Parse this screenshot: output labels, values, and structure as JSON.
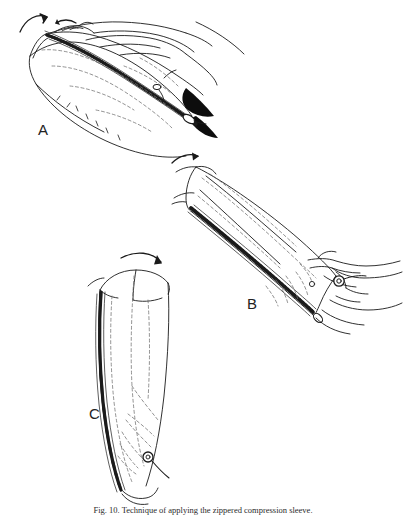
{
  "figure": {
    "background_color": "#ffffff",
    "ink_color": "#1a1a1a",
    "dash_color": "#6f6f6f",
    "caption_number": "Fig. 10.",
    "caption_text": "Technique of applying the zippered compression sleeve.",
    "panels": [
      {
        "id": "A",
        "label": "A",
        "description": "Forearm lying horizontally with the opened zippered sleeve positioned beneath it; two curved arrows at the upper left indicate the direction of rolling the sleeve onto the limb. The open zipper track runs along the lower edge with a dark wedge of shadow at the distal end.",
        "arrow_count": 2,
        "has_hand": true,
        "has_zipper": true,
        "zipper_state": "open"
      },
      {
        "id": "B",
        "label": "B",
        "description": "The sleeve drawn as a tilted cylinder with the zipper chain along the lower left edge; two hands grasp the distal end and pull the zipper slider upward. A single curved arrow at the upper left shows the direction of advancement.",
        "arrow_count": 1,
        "has_hand": true,
        "has_zipper": true,
        "zipper_state": "closing"
      },
      {
        "id": "C",
        "label": "C",
        "description": "The sleeve shown upright and fully seated on the limb with the zipper closed along the left edge; a curved arrow above indicates final smoothing of the proximal cuff. The zipper pull ring rests near the distal end.",
        "arrow_count": 1,
        "has_hand": false,
        "has_zipper": true,
        "zipper_state": "closed"
      }
    ]
  }
}
